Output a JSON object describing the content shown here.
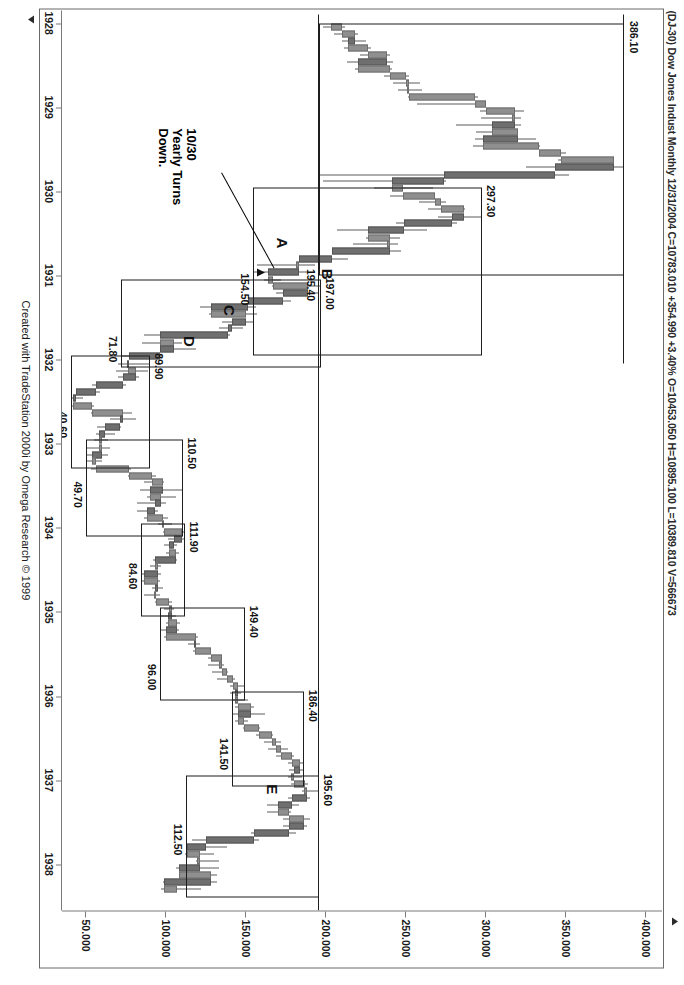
{
  "header": {
    "symbol": "(DJ-30) Dow Jones Indust Monthly",
    "date": "12/31/2004",
    "quote": "C=10783.010 +354.990 +3.40% O=10453.050 H=10895.100 L=10389.810 V=566673",
    "full": "(DJ-30) Dow Jones Indust Monthly  12/31/2004  C=10783.010 +354.990 +3.40%  O=10453.050  H=10895.100  L=10389.810  V=566673"
  },
  "footer": {
    "credit": "Created with TradeStation 2000i by Omega Research © 1999"
  },
  "annotation": {
    "note": "10/30\nYearly Turns\nDown."
  },
  "chart_data": {
    "type": "bar",
    "title": "(DJ-30) Dow Jones Indust Monthly",
    "xlabel": "",
    "ylabel": "",
    "ylim": [
      50,
      400
    ],
    "grid": false,
    "legend": "none",
    "price_ticks": [
      "400.000",
      "350.000",
      "300.000",
      "250.000",
      "200.000",
      "150.000",
      "100.000",
      "50.000"
    ],
    "price_tick_values": [
      400,
      350,
      300,
      250,
      200,
      150,
      100,
      50
    ],
    "date_ticks": [
      "1928",
      "1929",
      "1930",
      "1931",
      "1932",
      "1933",
      "1934",
      "1935",
      "1936",
      "1937",
      "1938"
    ],
    "date_tick_values": [
      1928,
      1929,
      1930,
      1931,
      1932,
      1933,
      1934,
      1935,
      1936,
      1937,
      1938
    ],
    "price_tags": [
      "386.10",
      "297.30",
      "195.40",
      "154.50",
      "197.00",
      "71.80",
      "89.90",
      "40.60",
      "110.50",
      "49.70",
      "111.90",
      "84.60",
      "149.40",
      "96.00",
      "186.40",
      "141.50",
      "195.60",
      "112.50"
    ],
    "swing_labels": [
      "A",
      "B",
      "C",
      "D",
      "E"
    ],
    "swings": [
      {
        "label": "",
        "high": 386.1,
        "low": 195.4,
        "from": "1929",
        "to": "1930"
      },
      {
        "label": "A",
        "high": 297.3,
        "low": 154.5,
        "from": "1930",
        "to": "1931"
      },
      {
        "label": "B",
        "high": 197.0,
        "low": 71.8,
        "from": "1931",
        "to": "1932"
      },
      {
        "label": "C",
        "high": 89.9,
        "low": 40.6,
        "from": "1932",
        "to": "1932"
      },
      {
        "label": "D",
        "high": 110.5,
        "low": 49.7,
        "from": "1933",
        "to": "1933"
      },
      {
        "label": "",
        "high": 111.9,
        "low": 84.6,
        "from": "1934",
        "to": "1934"
      },
      {
        "label": "",
        "high": 149.4,
        "low": 96.0,
        "from": "1935",
        "to": "1935"
      },
      {
        "label": "",
        "high": 186.4,
        "low": 141.5,
        "from": "1936",
        "to": "1937"
      },
      {
        "label": "E",
        "high": 195.6,
        "low": 112.5,
        "from": "1937",
        "to": "1938"
      }
    ],
    "monthly_bars": [
      {
        "x": 1928.05,
        "o": 203,
        "h": 212,
        "l": 198,
        "c": 210
      },
      {
        "x": 1928.13,
        "o": 210,
        "h": 220,
        "l": 205,
        "c": 218
      },
      {
        "x": 1928.21,
        "o": 218,
        "h": 225,
        "l": 210,
        "c": 214
      },
      {
        "x": 1928.3,
        "o": 214,
        "h": 228,
        "l": 211,
        "c": 226
      },
      {
        "x": 1928.38,
        "o": 226,
        "h": 240,
        "l": 221,
        "c": 238
      },
      {
        "x": 1928.46,
        "o": 238,
        "h": 242,
        "l": 213,
        "c": 220
      },
      {
        "x": 1928.55,
        "o": 220,
        "h": 241,
        "l": 218,
        "c": 240
      },
      {
        "x": 1928.63,
        "o": 240,
        "h": 252,
        "l": 236,
        "c": 250
      },
      {
        "x": 1928.71,
        "o": 250,
        "h": 259,
        "l": 242,
        "c": 252
      },
      {
        "x": 1928.8,
        "o": 252,
        "h": 260,
        "l": 245,
        "c": 252
      },
      {
        "x": 1928.88,
        "o": 252,
        "h": 295,
        "l": 251,
        "c": 293
      },
      {
        "x": 1928.96,
        "o": 293,
        "h": 300,
        "l": 257,
        "c": 300
      },
      {
        "x": 1929.05,
        "o": 300,
        "h": 324,
        "l": 296,
        "c": 318
      },
      {
        "x": 1929.13,
        "o": 318,
        "h": 322,
        "l": 297,
        "c": 318
      },
      {
        "x": 1929.21,
        "o": 318,
        "h": 322,
        "l": 281,
        "c": 304
      },
      {
        "x": 1929.3,
        "o": 304,
        "h": 320,
        "l": 294,
        "c": 320
      },
      {
        "x": 1929.38,
        "o": 320,
        "h": 331,
        "l": 293,
        "c": 298
      },
      {
        "x": 1929.46,
        "o": 298,
        "h": 334,
        "l": 292,
        "c": 333
      },
      {
        "x": 1929.55,
        "o": 333,
        "h": 350,
        "l": 337,
        "c": 347
      },
      {
        "x": 1929.63,
        "o": 347,
        "h": 380,
        "l": 345,
        "c": 380
      },
      {
        "x": 1929.71,
        "o": 380,
        "h": 386.1,
        "l": 325,
        "c": 343
      },
      {
        "x": 1929.8,
        "o": 343,
        "h": 352,
        "l": 195.4,
        "c": 274
      },
      {
        "x": 1929.88,
        "o": 274,
        "h": 275,
        "l": 198,
        "c": 241
      },
      {
        "x": 1929.96,
        "o": 241,
        "h": 267,
        "l": 230,
        "c": 248
      },
      {
        "x": 1930.05,
        "o": 248,
        "h": 268,
        "l": 240,
        "c": 268
      },
      {
        "x": 1930.13,
        "o": 268,
        "h": 275,
        "l": 258,
        "c": 272
      },
      {
        "x": 1930.21,
        "o": 272,
        "h": 287,
        "l": 264,
        "c": 286
      },
      {
        "x": 1930.3,
        "o": 286,
        "h": 297.3,
        "l": 270,
        "c": 279
      },
      {
        "x": 1930.38,
        "o": 279,
        "h": 282,
        "l": 244,
        "c": 249
      },
      {
        "x": 1930.46,
        "o": 249,
        "h": 263,
        "l": 207,
        "c": 226
      },
      {
        "x": 1930.55,
        "o": 226,
        "h": 246,
        "l": 225,
        "c": 240
      },
      {
        "x": 1930.63,
        "o": 240,
        "h": 245,
        "l": 217,
        "c": 240
      },
      {
        "x": 1930.71,
        "o": 240,
        "h": 247,
        "l": 204,
        "c": 204
      },
      {
        "x": 1930.8,
        "o": 204,
        "h": 214,
        "l": 183,
        "c": 183
      },
      {
        "x": 1930.88,
        "o": 183,
        "h": 193,
        "l": 157,
        "c": 183
      },
      {
        "x": 1930.96,
        "o": 183,
        "h": 189,
        "l": 154.5,
        "c": 164
      },
      {
        "x": 1931.05,
        "o": 164,
        "h": 172,
        "l": 161,
        "c": 167
      },
      {
        "x": 1931.13,
        "o": 167,
        "h": 197.0,
        "l": 166,
        "c": 189
      },
      {
        "x": 1931.21,
        "o": 189,
        "h": 195,
        "l": 169,
        "c": 173
      },
      {
        "x": 1931.3,
        "o": 173,
        "h": 178,
        "l": 149,
        "c": 151
      },
      {
        "x": 1931.38,
        "o": 151,
        "h": 156,
        "l": 121,
        "c": 128
      },
      {
        "x": 1931.46,
        "o": 128,
        "h": 157,
        "l": 127,
        "c": 150
      },
      {
        "x": 1931.55,
        "o": 150,
        "h": 155,
        "l": 135,
        "c": 141
      },
      {
        "x": 1931.63,
        "o": 141,
        "h": 148,
        "l": 133,
        "c": 139
      },
      {
        "x": 1931.71,
        "o": 139,
        "h": 140,
        "l": 86,
        "c": 96
      },
      {
        "x": 1931.8,
        "o": 96,
        "h": 110,
        "l": 85,
        "c": 105
      },
      {
        "x": 1931.88,
        "o": 105,
        "h": 119,
        "l": 96,
        "c": 96
      },
      {
        "x": 1931.96,
        "o": 96,
        "h": 98,
        "l": 71.8,
        "c": 77
      },
      {
        "x": 1932.05,
        "o": 77,
        "h": 89.9,
        "l": 70,
        "c": 76
      },
      {
        "x": 1932.13,
        "o": 76,
        "h": 89,
        "l": 69,
        "c": 81
      },
      {
        "x": 1932.21,
        "o": 81,
        "h": 83,
        "l": 70,
        "c": 73
      },
      {
        "x": 1932.3,
        "o": 73,
        "h": 75,
        "l": 54,
        "c": 56
      },
      {
        "x": 1932.38,
        "o": 56,
        "h": 59,
        "l": 44,
        "c": 44
      },
      {
        "x": 1932.46,
        "o": 44,
        "h": 48,
        "l": 40.6,
        "c": 42
      },
      {
        "x": 1932.55,
        "o": 42,
        "h": 55,
        "l": 41,
        "c": 54
      },
      {
        "x": 1932.63,
        "o": 54,
        "h": 79,
        "l": 53,
        "c": 73
      },
      {
        "x": 1932.71,
        "o": 73,
        "h": 81,
        "l": 65,
        "c": 71
      },
      {
        "x": 1932.8,
        "o": 71,
        "h": 72,
        "l": 57,
        "c": 62
      },
      {
        "x": 1932.88,
        "o": 62,
        "h": 68,
        "l": 56,
        "c": 58
      },
      {
        "x": 1932.96,
        "o": 58,
        "h": 64,
        "l": 55,
        "c": 60
      },
      {
        "x": 1933.05,
        "o": 60,
        "h": 65,
        "l": 49.7,
        "c": 60
      },
      {
        "x": 1933.13,
        "o": 60,
        "h": 64,
        "l": 50,
        "c": 54
      },
      {
        "x": 1933.21,
        "o": 54,
        "h": 60,
        "l": 50,
        "c": 56
      },
      {
        "x": 1933.3,
        "o": 56,
        "h": 78,
        "l": 53,
        "c": 77
      },
      {
        "x": 1933.38,
        "o": 77,
        "h": 94,
        "l": 76,
        "c": 91
      },
      {
        "x": 1933.46,
        "o": 91,
        "h": 99,
        "l": 86,
        "c": 98
      },
      {
        "x": 1933.55,
        "o": 98,
        "h": 110.5,
        "l": 84,
        "c": 90
      },
      {
        "x": 1933.63,
        "o": 90,
        "h": 106,
        "l": 88,
        "c": 97
      },
      {
        "x": 1933.71,
        "o": 97,
        "h": 100,
        "l": 82,
        "c": 93
      },
      {
        "x": 1933.8,
        "o": 93,
        "h": 95,
        "l": 82,
        "c": 88
      },
      {
        "x": 1933.88,
        "o": 88,
        "h": 101,
        "l": 86,
        "c": 98
      },
      {
        "x": 1933.96,
        "o": 98,
        "h": 104,
        "l": 95,
        "c": 99
      },
      {
        "x": 1934.05,
        "o": 99,
        "h": 111.9,
        "l": 98,
        "c": 110
      },
      {
        "x": 1934.13,
        "o": 110,
        "h": 111,
        "l": 101,
        "c": 105
      },
      {
        "x": 1934.21,
        "o": 105,
        "h": 107,
        "l": 99,
        "c": 102
      },
      {
        "x": 1934.3,
        "o": 102,
        "h": 108,
        "l": 100,
        "c": 106
      },
      {
        "x": 1934.38,
        "o": 106,
        "h": 107,
        "l": 92,
        "c": 93
      },
      {
        "x": 1934.46,
        "o": 93,
        "h": 97,
        "l": 90,
        "c": 95
      },
      {
        "x": 1934.55,
        "o": 95,
        "h": 97,
        "l": 84.6,
        "c": 86
      },
      {
        "x": 1934.63,
        "o": 86,
        "h": 96,
        "l": 85,
        "c": 95
      },
      {
        "x": 1934.71,
        "o": 95,
        "h": 98,
        "l": 91,
        "c": 93
      },
      {
        "x": 1934.8,
        "o": 93,
        "h": 96,
        "l": 86,
        "c": 94
      },
      {
        "x": 1934.88,
        "o": 94,
        "h": 104,
        "l": 93,
        "c": 102
      },
      {
        "x": 1934.96,
        "o": 102,
        "h": 105,
        "l": 99,
        "c": 104
      },
      {
        "x": 1935.05,
        "o": 104,
        "h": 106,
        "l": 96.0,
        "c": 101
      },
      {
        "x": 1935.13,
        "o": 101,
        "h": 109,
        "l": 100,
        "c": 107
      },
      {
        "x": 1935.21,
        "o": 107,
        "h": 108,
        "l": 96,
        "c": 100
      },
      {
        "x": 1935.3,
        "o": 100,
        "h": 120,
        "l": 99,
        "c": 119
      },
      {
        "x": 1935.38,
        "o": 119,
        "h": 121,
        "l": 114,
        "c": 118
      },
      {
        "x": 1935.46,
        "o": 118,
        "h": 128,
        "l": 117,
        "c": 128
      },
      {
        "x": 1935.55,
        "o": 128,
        "h": 135,
        "l": 126,
        "c": 135
      },
      {
        "x": 1935.63,
        "o": 135,
        "h": 136,
        "l": 126,
        "c": 135
      },
      {
        "x": 1935.71,
        "o": 135,
        "h": 139,
        "l": 129,
        "c": 138
      },
      {
        "x": 1935.8,
        "o": 138,
        "h": 143,
        "l": 132,
        "c": 142
      },
      {
        "x": 1935.88,
        "o": 142,
        "h": 149.4,
        "l": 140,
        "c": 145
      },
      {
        "x": 1935.96,
        "o": 145,
        "h": 147,
        "l": 140,
        "c": 144
      },
      {
        "x": 1936.05,
        "o": 144,
        "h": 151,
        "l": 142,
        "c": 145
      },
      {
        "x": 1936.13,
        "o": 145,
        "h": 155,
        "l": 143,
        "c": 153
      },
      {
        "x": 1936.21,
        "o": 153,
        "h": 162,
        "l": 141.5,
        "c": 145
      },
      {
        "x": 1936.3,
        "o": 145,
        "h": 151,
        "l": 143,
        "c": 149
      },
      {
        "x": 1936.38,
        "o": 149,
        "h": 159,
        "l": 148,
        "c": 158
      },
      {
        "x": 1936.46,
        "o": 158,
        "h": 167,
        "l": 156,
        "c": 166
      },
      {
        "x": 1936.55,
        "o": 166,
        "h": 172,
        "l": 161,
        "c": 169
      },
      {
        "x": 1936.63,
        "o": 169,
        "h": 176,
        "l": 164,
        "c": 172
      },
      {
        "x": 1936.71,
        "o": 172,
        "h": 180,
        "l": 169,
        "c": 179
      },
      {
        "x": 1936.8,
        "o": 179,
        "h": 186,
        "l": 176,
        "c": 184
      },
      {
        "x": 1936.88,
        "o": 184,
        "h": 186.4,
        "l": 177,
        "c": 180
      },
      {
        "x": 1936.96,
        "o": 180,
        "h": 185,
        "l": 176,
        "c": 180
      },
      {
        "x": 1937.05,
        "o": 180,
        "h": 189,
        "l": 178,
        "c": 187
      },
      {
        "x": 1937.13,
        "o": 187,
        "h": 195.6,
        "l": 185,
        "c": 188
      },
      {
        "x": 1937.21,
        "o": 188,
        "h": 190,
        "l": 176,
        "c": 179
      },
      {
        "x": 1937.3,
        "o": 179,
        "h": 183,
        "l": 163,
        "c": 170
      },
      {
        "x": 1937.38,
        "o": 170,
        "h": 178,
        "l": 163,
        "c": 177
      },
      {
        "x": 1937.46,
        "o": 177,
        "h": 190,
        "l": 173,
        "c": 186
      },
      {
        "x": 1937.55,
        "o": 186,
        "h": 188,
        "l": 173,
        "c": 177
      },
      {
        "x": 1937.63,
        "o": 177,
        "h": 181,
        "l": 153,
        "c": 155
      },
      {
        "x": 1937.71,
        "o": 155,
        "h": 158,
        "l": 116,
        "c": 125
      },
      {
        "x": 1937.8,
        "o": 125,
        "h": 138,
        "l": 112.5,
        "c": 113
      },
      {
        "x": 1937.88,
        "o": 113,
        "h": 130,
        "l": 112,
        "c": 121
      },
      {
        "x": 1937.96,
        "o": 121,
        "h": 133,
        "l": 119,
        "c": 121
      },
      {
        "x": 1938.05,
        "o": 121,
        "h": 133,
        "l": 106,
        "c": 108
      },
      {
        "x": 1938.13,
        "o": 108,
        "h": 132,
        "l": 117,
        "c": 128
      },
      {
        "x": 1938.21,
        "o": 128,
        "h": 132,
        "l": 98,
        "c": 99
      },
      {
        "x": 1938.3,
        "o": 99,
        "h": 122,
        "l": 97,
        "c": 107
      }
    ]
  }
}
